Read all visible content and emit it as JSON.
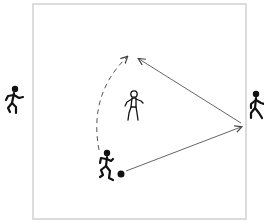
{
  "diagram": {
    "type": "soccer-drill",
    "field": {
      "border_color": "#dcdcdc",
      "background": "#ffffff"
    },
    "colors": {
      "player_fill": "#111111",
      "arrow": "#555555",
      "ball": "#111111"
    },
    "players": [
      {
        "id": "left-player",
        "style": "solid",
        "pose": "running",
        "position": "outside-left"
      },
      {
        "id": "center-player",
        "style": "outline",
        "pose": "standing",
        "position": "center"
      },
      {
        "id": "right-player",
        "style": "solid",
        "pose": "running",
        "position": "outside-right"
      },
      {
        "id": "dribbler",
        "style": "solid",
        "pose": "dribbling",
        "position": "bottom-center",
        "has_ball": true
      }
    ],
    "arrows": [
      {
        "id": "dribble-run",
        "style": "dashed",
        "from": "dribbler",
        "to": "top-center",
        "meaning": "player run"
      },
      {
        "id": "pass-to-right",
        "style": "solid",
        "from": "ball",
        "to": "right-player",
        "meaning": "pass"
      },
      {
        "id": "return-pass",
        "style": "solid",
        "from": "right-player",
        "to": "top-center",
        "meaning": "pass"
      }
    ]
  }
}
